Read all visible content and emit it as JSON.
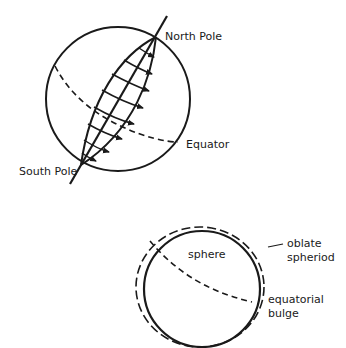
{
  "figure": {
    "top_diagram": {
      "labels": {
        "north_pole": "North Pole",
        "south_pole": "South Pole",
        "equator": "Equator"
      }
    },
    "bottom_diagram": {
      "labels": {
        "sphere": "sphere",
        "oblate_line1": "oblate",
        "oblate_line2": "spheriod",
        "bulge_line1": "equatorial",
        "bulge_line2": "bulge"
      }
    },
    "colors": {
      "ink": "#1a1a1a",
      "background": "#ffffff"
    }
  }
}
